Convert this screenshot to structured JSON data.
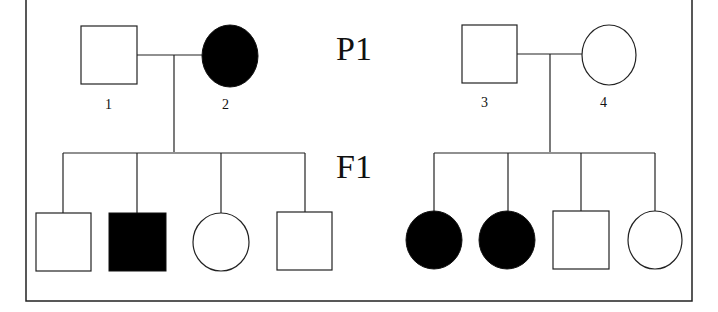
{
  "diagram": {
    "type": "pedigree",
    "generations": [
      {
        "label": "P1"
      },
      {
        "label": "F1"
      }
    ],
    "families": [
      {
        "parents": [
          {
            "id": "1",
            "label": "1",
            "sex": "male",
            "affected": false
          },
          {
            "id": "2",
            "label": "2",
            "sex": "female",
            "affected": true
          }
        ],
        "children": [
          {
            "sex": "male",
            "affected": false
          },
          {
            "sex": "male",
            "affected": true
          },
          {
            "sex": "female",
            "affected": false
          },
          {
            "sex": "male",
            "affected": false
          }
        ]
      },
      {
        "parents": [
          {
            "id": "3",
            "label": "3",
            "sex": "male",
            "affected": false
          },
          {
            "id": "4",
            "label": "4",
            "sex": "female",
            "affected": false
          }
        ],
        "children": [
          {
            "sex": "female",
            "affected": true
          },
          {
            "sex": "female",
            "affected": true
          },
          {
            "sex": "male",
            "affected": false
          },
          {
            "sex": "female",
            "affected": false
          }
        ]
      }
    ],
    "colors": {
      "affected": "#000000",
      "unaffected": "#ffffff",
      "stroke": "#222222"
    }
  }
}
